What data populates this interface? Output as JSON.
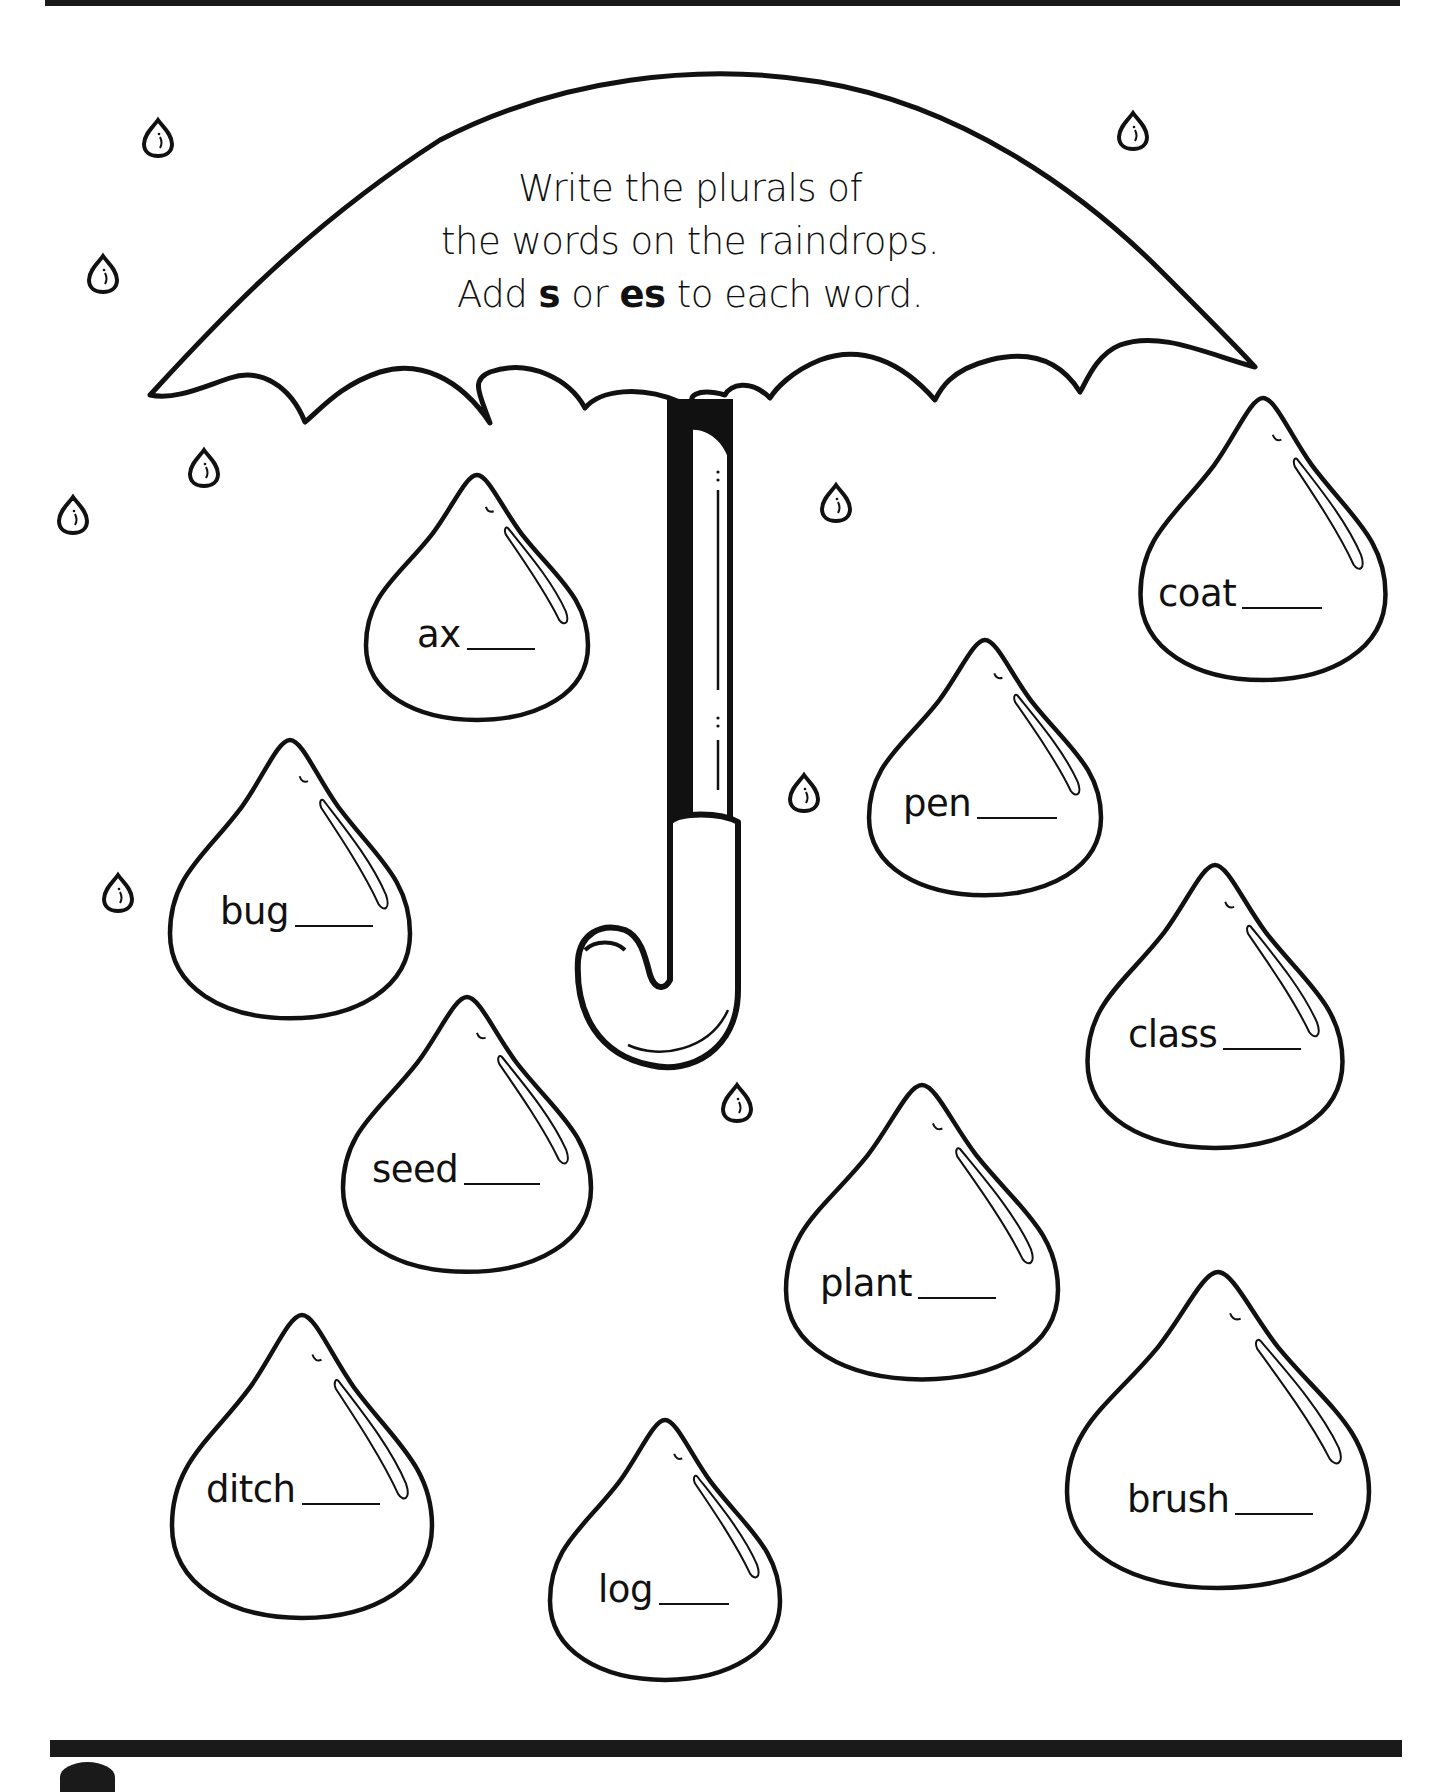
{
  "instructions": {
    "line1": "Write the plurals of",
    "line2": "the words on the raindrops.",
    "line3_prefix": "Add ",
    "line3_bold1": "s",
    "line3_mid": " or ",
    "line3_bold2": "es",
    "line3_suffix": " to each word."
  },
  "raindrops": [
    {
      "word": "ax",
      "answer": ""
    },
    {
      "word": "coat",
      "answer": ""
    },
    {
      "word": "pen",
      "answer": ""
    },
    {
      "word": "bug",
      "answer": ""
    },
    {
      "word": "class",
      "answer": ""
    },
    {
      "word": "seed",
      "answer": ""
    },
    {
      "word": "plant",
      "answer": ""
    },
    {
      "word": "ditch",
      "answer": ""
    },
    {
      "word": "brush",
      "answer": ""
    },
    {
      "word": "log",
      "answer": ""
    }
  ],
  "colors": {
    "ink": "#111111",
    "paper": "#ffffff"
  }
}
